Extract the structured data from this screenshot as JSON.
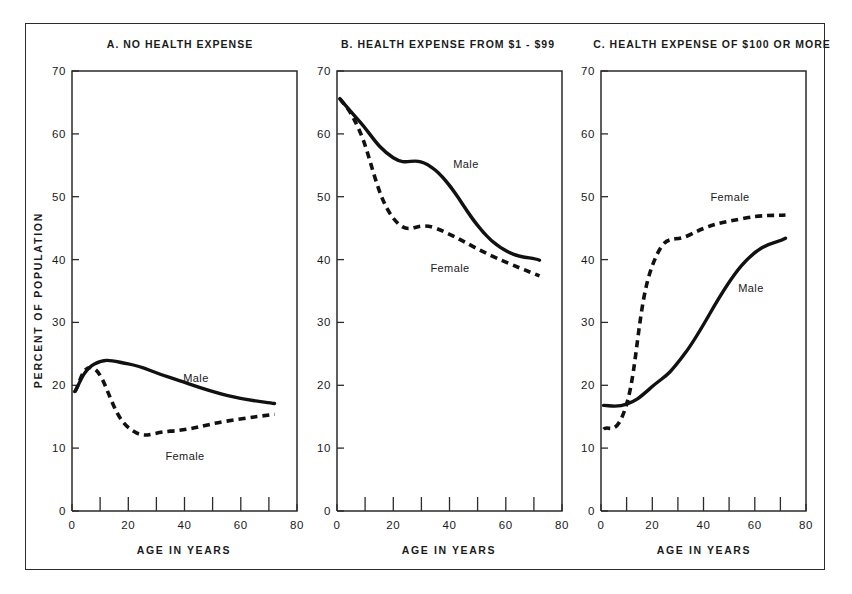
{
  "figure": {
    "y_axis_title": "PERCENT OF POPULATION",
    "x_axis_title": "AGE IN YEARS"
  },
  "chart_data": [
    {
      "type": "line",
      "title": "A. NO HEALTH EXPENSE",
      "xlabel": "AGE IN YEARS",
      "ylabel": "PERCENT OF POPULATION",
      "xlim": [
        0,
        80
      ],
      "ylim": [
        0,
        70
      ],
      "xticks": [
        0,
        20,
        40,
        60,
        80
      ],
      "xticks_minor": [
        10,
        30,
        50,
        70
      ],
      "yticks": [
        0,
        10,
        20,
        30,
        40,
        50,
        60,
        70
      ],
      "grid": false,
      "legend": "inline-labels",
      "series": [
        {
          "name": "Male",
          "style": "solid",
          "x": [
            1,
            8,
            20,
            35,
            55,
            72
          ],
          "values": [
            19.0,
            23.4,
            23.4,
            21.2,
            18.4,
            17.1
          ]
        },
        {
          "name": "Female",
          "style": "dashed",
          "x": [
            1,
            8,
            20,
            35,
            55,
            72
          ],
          "values": [
            19.0,
            22.6,
            13.3,
            12.7,
            14.3,
            15.4
          ]
        }
      ]
    },
    {
      "type": "line",
      "title": "B. HEALTH EXPENSE FROM $1 - $99",
      "xlabel": "AGE IN YEARS",
      "ylabel": "PERCENT OF POPULATION",
      "xlim": [
        0,
        80
      ],
      "ylim": [
        0,
        70
      ],
      "xticks": [
        0,
        20,
        40,
        60,
        80
      ],
      "xticks_minor": [
        10,
        30,
        50,
        70
      ],
      "yticks": [
        0,
        10,
        20,
        30,
        40,
        50,
        60,
        70
      ],
      "grid": false,
      "legend": "inline-labels",
      "series": [
        {
          "name": "Male",
          "style": "solid",
          "x": [
            1,
            8,
            20,
            35,
            55,
            72
          ],
          "values": [
            65.6,
            62.0,
            56.2,
            54.2,
            43.0,
            39.9
          ]
        },
        {
          "name": "Female",
          "style": "dashed",
          "x": [
            1,
            8,
            20,
            35,
            55,
            72
          ],
          "values": [
            65.6,
            60.5,
            46.6,
            45.0,
            40.6,
            37.4
          ]
        }
      ]
    },
    {
      "type": "line",
      "title": "C. HEALTH EXPENSE OF $100 OR MORE",
      "xlabel": "AGE IN YEARS",
      "ylabel": "PERCENT OF POPULATION",
      "xlim": [
        0,
        80
      ],
      "ylim": [
        0,
        70
      ],
      "xticks": [
        0,
        20,
        40,
        60,
        80
      ],
      "xticks_minor": [
        10,
        30,
        50,
        70
      ],
      "yticks": [
        0,
        10,
        20,
        30,
        40,
        50,
        60,
        70
      ],
      "grid": false,
      "legend": "inline-labels",
      "series": [
        {
          "name": "Male",
          "style": "solid",
          "x": [
            1,
            10,
            20,
            33,
            55,
            72
          ],
          "values": [
            16.8,
            17.0,
            19.8,
            25.2,
            39.1,
            43.4
          ]
        },
        {
          "name": "Female",
          "style": "dashed",
          "x": [
            1,
            10,
            20,
            35,
            55,
            72
          ],
          "values": [
            13.0,
            17.0,
            39.0,
            44.0,
            46.5,
            47.1
          ]
        }
      ]
    }
  ],
  "panels": [
    {
      "id": "A",
      "title": "A. NO HEALTH EXPENSE",
      "series_labels": [
        {
          "name": "Male",
          "text": "Male"
        },
        {
          "name": "Female",
          "text": "Female"
        }
      ],
      "ytick_labels": [
        "0",
        "10",
        "20",
        "30",
        "40",
        "50",
        "60",
        "70"
      ],
      "xtick_labels": [
        "0",
        "20",
        "40",
        "60",
        "80"
      ],
      "x_axis_title": "AGE IN YEARS"
    },
    {
      "id": "B",
      "title": "B. HEALTH EXPENSE FROM $1 - $99",
      "series_labels": [
        {
          "name": "Male",
          "text": "Male"
        },
        {
          "name": "Female",
          "text": "Female"
        }
      ],
      "ytick_labels": [
        "0",
        "10",
        "20",
        "30",
        "40",
        "50",
        "60",
        "70"
      ],
      "xtick_labels": [
        "0",
        "20",
        "40",
        "60",
        "80"
      ],
      "x_axis_title": "AGE IN YEARS"
    },
    {
      "id": "C",
      "title": "C. HEALTH EXPENSE OF $100 OR MORE",
      "series_labels": [
        {
          "name": "Male",
          "text": "Male"
        },
        {
          "name": "Female",
          "text": "Female"
        }
      ],
      "ytick_labels": [
        "0",
        "10",
        "20",
        "30",
        "40",
        "50",
        "60",
        "70"
      ],
      "xtick_labels": [
        "0",
        "20",
        "40",
        "60",
        "80"
      ],
      "x_axis_title": "AGE IN YEARS"
    }
  ]
}
